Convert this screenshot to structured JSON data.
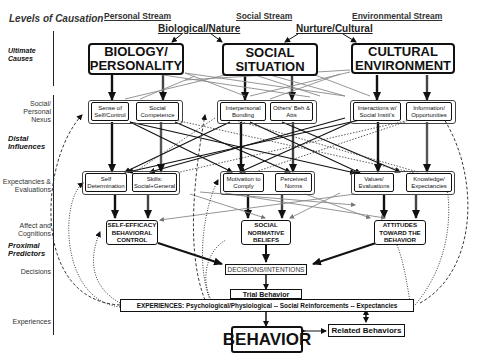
{
  "levels": {
    "title": "Levels of Causation",
    "rows": [
      {
        "label": "Ultimate Causes",
        "emphasis": true,
        "top": 62
      },
      {
        "label": "Social/ Personal Nexus",
        "emphasis": false,
        "top": 100
      },
      {
        "label": "Distal Influences",
        "emphasis": true,
        "top": 136
      },
      {
        "label": "Expectancies & Evaluations",
        "emphasis": false,
        "top": 179
      },
      {
        "label": "Affect and Cognitions",
        "emphasis": false,
        "top": 222
      },
      {
        "label": "Proximal Predictors",
        "emphasis": true,
        "top": 244
      },
      {
        "label": "Decisions",
        "emphasis": false,
        "top": 268
      },
      {
        "label": "Experiences",
        "emphasis": false,
        "top": 319
      }
    ]
  },
  "streams": {
    "personal": "Personal Stream",
    "social": "Social Stream",
    "environmental": "Environmental Stream",
    "biological": "Biological/Nature",
    "nurture": "Nurture/Cultural"
  },
  "ultimate": {
    "biology": "BIOLOGY/ PERSONALITY",
    "social": "SOCIAL SITUATION",
    "cultural": "CULTURAL ENVIRONMENT"
  },
  "nexus": {
    "sense_of_self": "Sense of Self/Control",
    "social_competence": "Social Competence",
    "interpersonal_bonding": "Interpersonal Bonding",
    "others_beh": "Others' Beh & Atts",
    "interactions": "Interactions w/ Social Instit's",
    "information": "Information/ Opportunities"
  },
  "expectancies": {
    "self_determination": "Self Determination",
    "skills": "Skills: Social+General",
    "motivation": "Motivation to Comply",
    "perceived_norms": "Perceived Norms",
    "values": "Values/ Evaluations",
    "knowledge": "Knowledge/ Expectancies"
  },
  "proximal": {
    "self_efficacy": "SELF-EFFICACY BEHAVIORAL CONTROL",
    "social_normative": "SOCIAL NORMATIVE BELIEFS",
    "attitudes": "ATTITUDES TOWARD THE BEHAVIOR"
  },
  "decisions": "DECISIONS/INTENTIONS",
  "trial_behavior": "Trial Behavior",
  "experiences": "EXPERIENCES: Psychological/Physiological -- Social Reinforcements -- Expectancies",
  "behavior": "BEHAVIOR",
  "related_behaviors": "Related Behaviors",
  "colors": {
    "ink": "#111111",
    "grey_line": "#8a8a8a",
    "background": "#ffffff"
  }
}
